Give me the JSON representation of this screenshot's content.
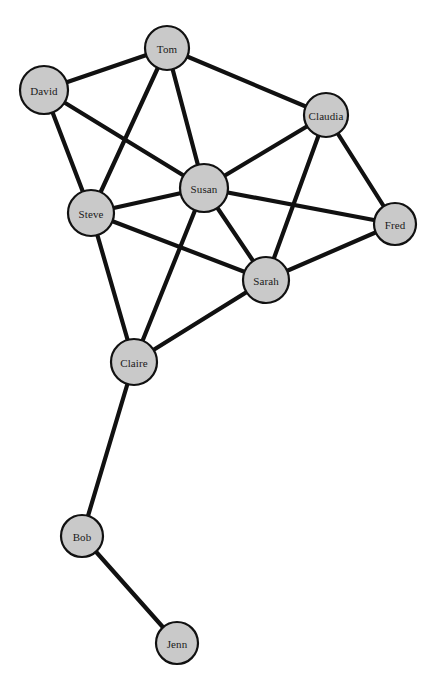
{
  "figure": {
    "background_color": "#ffffff"
  },
  "style": {
    "node_fill": "#c9c9c9",
    "node_stroke": "#111111",
    "edge_color": "#111111",
    "label_color": "#1a1a1a"
  },
  "chart_data": {
    "type": "diagram",
    "subtype": "node-link-network",
    "title": "",
    "xlabel": "",
    "ylabel": "",
    "directed": false,
    "weighted": false,
    "legend": [],
    "grid": false,
    "node_count": 10,
    "edge_count": 19,
    "nodes": [
      {
        "id": "Tom",
        "label": "Tom",
        "x": 167,
        "y": 48,
        "r": 22,
        "degree": 4
      },
      {
        "id": "David",
        "label": "David",
        "x": 44,
        "y": 90,
        "r": 24,
        "degree": 3
      },
      {
        "id": "Claudia",
        "label": "Claudia",
        "x": 326,
        "y": 115,
        "r": 22,
        "degree": 4
      },
      {
        "id": "Susan",
        "label": "Susan",
        "x": 204,
        "y": 188,
        "r": 24,
        "degree": 7
      },
      {
        "id": "Steve",
        "label": "Steve",
        "x": 91,
        "y": 213,
        "r": 23,
        "degree": 5
      },
      {
        "id": "Fred",
        "label": "Fred",
        "x": 395,
        "y": 224,
        "r": 21,
        "degree": 3
      },
      {
        "id": "Sarah",
        "label": "Sarah",
        "x": 266,
        "y": 280,
        "r": 23,
        "degree": 5
      },
      {
        "id": "Claire",
        "label": "Claire",
        "x": 134,
        "y": 362,
        "r": 23,
        "degree": 4
      },
      {
        "id": "Bob",
        "label": "Bob",
        "x": 82,
        "y": 536,
        "r": 21,
        "degree": 2
      },
      {
        "id": "Jenn",
        "label": "Jenn",
        "x": 177,
        "y": 643,
        "r": 21,
        "degree": 1
      }
    ],
    "edges": [
      {
        "source": "David",
        "target": "Tom"
      },
      {
        "source": "David",
        "target": "Steve"
      },
      {
        "source": "David",
        "target": "Susan"
      },
      {
        "source": "Tom",
        "target": "Steve"
      },
      {
        "source": "Tom",
        "target": "Susan"
      },
      {
        "source": "Tom",
        "target": "Claudia"
      },
      {
        "source": "Claudia",
        "target": "Susan"
      },
      {
        "source": "Claudia",
        "target": "Sarah"
      },
      {
        "source": "Claudia",
        "target": "Fred"
      },
      {
        "source": "Susan",
        "target": "Steve"
      },
      {
        "source": "Susan",
        "target": "Sarah"
      },
      {
        "source": "Susan",
        "target": "Fred"
      },
      {
        "source": "Susan",
        "target": "Claire"
      },
      {
        "source": "Steve",
        "target": "Sarah"
      },
      {
        "source": "Steve",
        "target": "Claire"
      },
      {
        "source": "Sarah",
        "target": "Fred"
      },
      {
        "source": "Sarah",
        "target": "Claire"
      },
      {
        "source": "Claire",
        "target": "Bob"
      },
      {
        "source": "Bob",
        "target": "Jenn"
      }
    ]
  }
}
